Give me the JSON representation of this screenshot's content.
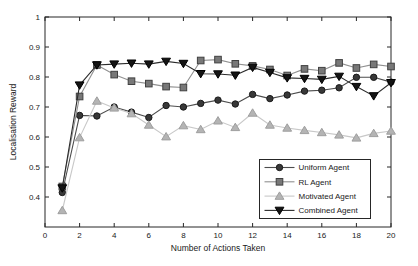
{
  "chart_data": {
    "type": "line",
    "title": "",
    "xlabel": "Number of Actions Taken",
    "ylabel": "Localisation Reward",
    "xlim": [
      0,
      20
    ],
    "ylim": [
      0.3,
      1.0
    ],
    "xticks": [
      0,
      2,
      4,
      6,
      8,
      10,
      12,
      14,
      16,
      18,
      20
    ],
    "yticks": [
      0.4,
      0.5,
      0.6,
      0.7,
      0.8,
      0.9,
      1.0
    ],
    "ytick_labels": [
      "0.4",
      "0.5",
      "0.6",
      "0.7",
      "0.8",
      "0.9",
      "1"
    ],
    "grid": false,
    "legend_position": "inside-bottom-right",
    "axis_color": "#262626",
    "x": [
      1,
      2,
      3,
      4,
      5,
      6,
      7,
      8,
      9,
      10,
      11,
      12,
      13,
      14,
      15,
      16,
      17,
      18,
      19,
      20
    ],
    "series": [
      {
        "name": "Uniform Agent",
        "marker": "circle",
        "line_color": "#4d4d4d",
        "marker_fill": "#383838",
        "marker_edge": "#1a1a1a",
        "values": [
          0.415,
          0.672,
          0.67,
          0.7,
          0.683,
          0.665,
          0.705,
          0.7,
          0.712,
          0.723,
          0.71,
          0.742,
          0.728,
          0.74,
          0.753,
          0.756,
          0.764,
          0.799,
          0.799,
          0.783
        ]
      },
      {
        "name": "RL Agent",
        "marker": "square",
        "line_color": "#909090",
        "marker_fill": "#787878",
        "marker_edge": "#404040",
        "values": [
          0.435,
          0.735,
          0.84,
          0.808,
          0.786,
          0.778,
          0.768,
          0.765,
          0.855,
          0.858,
          0.844,
          0.837,
          0.825,
          0.805,
          0.827,
          0.821,
          0.847,
          0.83,
          0.842,
          0.835
        ]
      },
      {
        "name": "Motivated Agent",
        "marker": "triangle-up",
        "line_color": "#c8c8c8",
        "marker_fill": "#b4b4b4",
        "marker_edge": "#9e9e9e",
        "values": [
          0.355,
          0.598,
          0.72,
          0.697,
          0.678,
          0.64,
          0.601,
          0.638,
          0.625,
          0.654,
          0.632,
          0.68,
          0.64,
          0.63,
          0.622,
          0.615,
          0.607,
          0.597,
          0.612,
          0.62
        ]
      },
      {
        "name": "Combined Agent",
        "marker": "triangle-down",
        "line_color": "#2b2b2b",
        "marker_fill": "#141414",
        "marker_edge": "#000000",
        "values": [
          0.43,
          0.773,
          0.84,
          0.843,
          0.846,
          0.843,
          0.852,
          0.845,
          0.811,
          0.81,
          0.806,
          0.832,
          0.815,
          0.797,
          0.795,
          0.792,
          0.802,
          0.768,
          0.737,
          0.781
        ]
      }
    ]
  }
}
